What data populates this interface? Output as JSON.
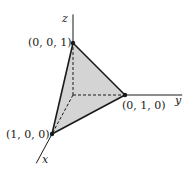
{
  "diagram": {
    "type": "3d-coordinate-tetrahedron",
    "axes": [
      {
        "name": "x",
        "label": "x"
      },
      {
        "name": "y",
        "label": "y"
      },
      {
        "name": "z",
        "label": "z"
      }
    ],
    "vertices": [
      {
        "id": "origin",
        "coords": [
          0,
          0,
          0
        ],
        "label": ""
      },
      {
        "id": "x-vertex",
        "coords": [
          1,
          0,
          0
        ],
        "label": "(1, 0, 0)"
      },
      {
        "id": "y-vertex",
        "coords": [
          0,
          1,
          0
        ],
        "label": "(0, 1, 0)"
      },
      {
        "id": "z-vertex",
        "coords": [
          0,
          0,
          1
        ],
        "label": "(0, 0, 1)"
      }
    ],
    "solid_edges": [
      [
        "z-vertex",
        "x-vertex"
      ],
      [
        "z-vertex",
        "y-vertex"
      ],
      [
        "x-vertex",
        "y-vertex"
      ]
    ],
    "hidden_edges": [
      [
        "origin",
        "x-vertex"
      ],
      [
        "origin",
        "y-vertex"
      ],
      [
        "origin",
        "z-vertex"
      ]
    ],
    "shaded_face": [
      "x-vertex",
      "y-vertex",
      "z-vertex"
    ],
    "colors": {
      "line": "#1a1a1a",
      "face": "#d4d4d4"
    }
  }
}
